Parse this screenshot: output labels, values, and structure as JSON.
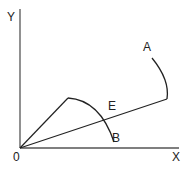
{
  "diagram": {
    "type": "geometry-arcs",
    "axes": {
      "x_label": "X",
      "y_label": "Y",
      "origin_label": "0"
    },
    "points": {
      "A": "A",
      "B": "B",
      "E": "E"
    },
    "colors": {
      "line": "#222222",
      "axis": "#555555",
      "background": "#ffffff"
    }
  }
}
